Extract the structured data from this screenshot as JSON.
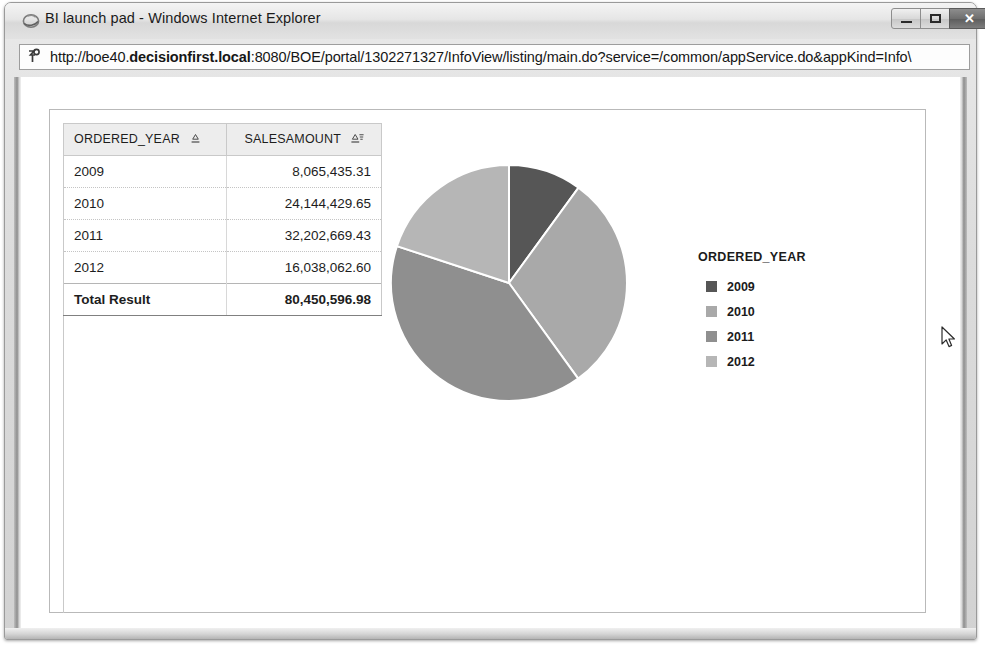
{
  "window": {
    "title": "BI launch pad - Windows Internet Explorer",
    "icon": "ie-logo-icon",
    "controls": {
      "minimize_label": "",
      "maximize_label": "",
      "close_label": "✕"
    }
  },
  "address_bar": {
    "icon": "page-favicon-icon",
    "url_prefix": "http://boe40.",
    "url_bold": "decisionfirst.local",
    "url_suffix": ":8080/BOE/portal/1302271327/InfoView/listing/main.do?service=/common/appService.do&appKind=Info\\",
    "url_full": "http://boe40.decisionfirst.local:8080/BOE/portal/1302271327/InfoView/listing/main.do?service=/common/appService.do&appKind=Info\\"
  },
  "report": {
    "table": {
      "columns": [
        {
          "label": "ORDERED_YEAR",
          "sort_icon": "sort-ascending-icon"
        },
        {
          "label": "SALESAMOUNT",
          "sort_icon": "sort-descending-filter-icon"
        }
      ],
      "rows": [
        {
          "year": "2009",
          "amount": "8,065,435.31"
        },
        {
          "year": "2010",
          "amount": "24,144,429.65"
        },
        {
          "year": "2011",
          "amount": "32,202,669.43"
        },
        {
          "year": "2012",
          "amount": "16,038,062.60"
        }
      ],
      "total": {
        "year": "Total Result",
        "amount": "80,450,596.98"
      }
    },
    "legend": {
      "title": "ORDERED_YEAR",
      "items": [
        {
          "label": "2009",
          "color": "#565656"
        },
        {
          "label": "2010",
          "color": "#a9a9a9"
        },
        {
          "label": "2011",
          "color": "#8f8f8f"
        },
        {
          "label": "2012",
          "color": "#b6b6b6"
        }
      ]
    }
  },
  "chart_data": {
    "type": "pie",
    "title": "",
    "legend_title": "ORDERED_YEAR",
    "legend_position": "right",
    "categories": [
      "2009",
      "2010",
      "2011",
      "2012"
    ],
    "values": [
      8065435.31,
      24144429.65,
      32202669.43,
      16038062.6
    ],
    "value_labels": [
      "8,065,435.31",
      "24,144,429.65",
      "32,202,669.43",
      "16,038,062.60"
    ],
    "total": 80450596.98,
    "total_label": "80,450,596.98",
    "percentages": [
      10.02,
      30.01,
      40.03,
      19.94
    ],
    "colors": [
      "#565656",
      "#a9a9a9",
      "#8f8f8f",
      "#b6b6b6"
    ],
    "start_angle_deg": 0,
    "direction": "clockwise",
    "slice_border_color": "#ffffff",
    "xlabel": "",
    "ylabel": ""
  },
  "cursor": {
    "icon": "mouse-pointer-icon",
    "x": 935,
    "y": 258
  }
}
